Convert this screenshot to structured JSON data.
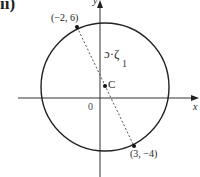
{
  "figure": {
    "part_label": "ii)",
    "axes": {
      "x_label": "x",
      "y_label": "y",
      "origin_label": "0"
    },
    "points": [
      {
        "label": "(−2, 6)",
        "x": -2,
        "y": 6
      },
      {
        "label": "(3, −4)",
        "x": 3,
        "y": -4
      }
    ],
    "center": {
      "label": "C"
    },
    "annotation": {
      "mark": "ɔ·ζ",
      "subscript": "1"
    },
    "colors": {
      "stroke": "#222222",
      "dashed": "#555555",
      "background": "#ffffff"
    }
  }
}
